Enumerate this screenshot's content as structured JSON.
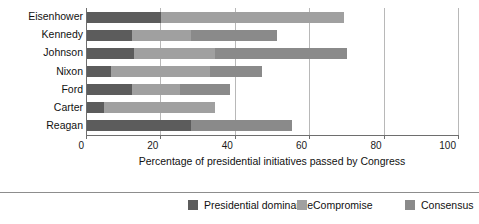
{
  "chart_data": {
    "type": "bar",
    "orientation": "horizontal",
    "stacked": true,
    "title": "",
    "xlabel": "Percentage of presidential initiatives passed by Congress",
    "ylabel": "President",
    "xlim": [
      0,
      100
    ],
    "xticks": [
      0,
      20,
      40,
      60,
      80,
      100
    ],
    "xtick_labels": [
      "0",
      "20",
      "40",
      "60",
      "80",
      "100"
    ],
    "grid": "vertical",
    "legend_position": "bottom",
    "categories": [
      "Eisenhower",
      "Kennedy",
      "Johnson",
      "Nixon",
      "Ford",
      "Carter",
      "Reagan"
    ],
    "series": [
      {
        "name": "Presidential dominance",
        "color": "#5c5c5c",
        "values": [
          20,
          12,
          12.5,
          6.5,
          12,
          4.5,
          28
        ]
      },
      {
        "name": "Compromise",
        "color": "#a0a0a0",
        "values": [
          49,
          16,
          22,
          26.5,
          13,
          30,
          0
        ]
      },
      {
        "name": "Consensus",
        "color": "#8a8a8a",
        "values": [
          0,
          23,
          35.5,
          14,
          13.5,
          0,
          27
        ]
      }
    ],
    "totals": [
      69,
      51,
      70,
      47,
      38.5,
      34.5,
      55
    ]
  },
  "legend": {
    "items": [
      {
        "label": "Presidential  dominance",
        "swatch_class": "sw-dominance",
        "left": 188
      },
      {
        "label": "Compromise",
        "swatch_class": "sw-compromise",
        "left": 297
      },
      {
        "label": "Consensus",
        "swatch_class": "sw-consensus",
        "left": 405
      }
    ]
  }
}
